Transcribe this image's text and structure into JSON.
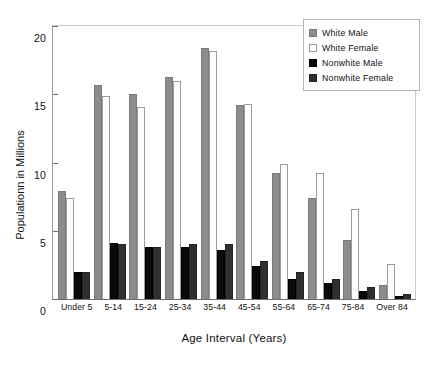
{
  "chart_data": {
    "type": "bar",
    "title": "",
    "xlabel": "Age Interval  (Years)",
    "ylabel": "Populationn in Millions",
    "categories": [
      "Under 5",
      "5-14",
      "15-24",
      "25-34",
      "35-44",
      "45-54",
      "55-64",
      "65-74",
      "75-84",
      "Over 84"
    ],
    "series": [
      {
        "name": "White Male",
        "color": "#8c8c8c",
        "values": [
          7.9,
          15.7,
          15.0,
          16.3,
          18.4,
          14.2,
          9.2,
          7.4,
          4.3,
          1.0
        ]
      },
      {
        "name": "White Female",
        "color": "#fdfdfd",
        "values": [
          7.4,
          14.9,
          14.1,
          16.0,
          18.2,
          14.3,
          9.9,
          9.2,
          6.6,
          2.6
        ]
      },
      {
        "name": "Nonwhite Male",
        "color": "#0a0a0a",
        "values": [
          2.0,
          4.1,
          3.8,
          3.8,
          3.6,
          2.4,
          1.5,
          1.2,
          0.6,
          0.2
        ]
      },
      {
        "name": "Nonwhite Female",
        "color": "#2f2f2f",
        "values": [
          2.0,
          4.0,
          3.8,
          4.0,
          4.0,
          2.8,
          2.0,
          1.5,
          0.9,
          0.4
        ]
      }
    ],
    "ylim": [
      0,
      20
    ],
    "yticks": [
      0,
      5,
      10,
      15,
      20
    ],
    "ytick_labels": [
      "0",
      "5",
      "10",
      "15",
      "20"
    ],
    "grid": false,
    "legend_position": "top-right"
  }
}
